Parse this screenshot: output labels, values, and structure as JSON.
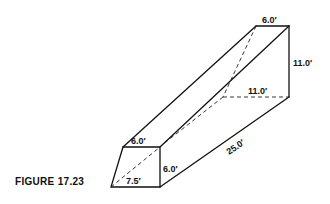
{
  "figure": {
    "caption": "FIGURE 17.23",
    "type": "isometric sketch of a trench excavation with sloped sides",
    "dimensions": {
      "front_top_width": "6.0′",
      "front_height": "6.0′",
      "front_bottom_width": "7.5′",
      "length": "25.0′",
      "back_top_width": "6.0′",
      "back_height": "11.0′",
      "back_bottom_width": "11.0′"
    }
  }
}
